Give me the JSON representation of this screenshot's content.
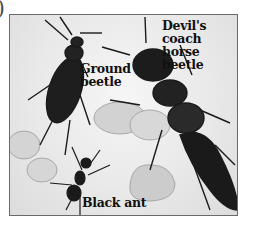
{
  "figure": {
    "partial_marker": ")",
    "labels": {
      "devils_coach_horse_beetle": "Devil's coach horse beetle",
      "devils_line1": "Devil's coach",
      "devils_line2": "horse beetle",
      "ground_beetle_line1": "Ground",
      "ground_beetle_line2": "beetle",
      "black_ant": "Black ant"
    },
    "colors": {
      "frame_border": "#6a6a6a",
      "insect_dark": "#1a1a1a",
      "stone": "#c8c8c8",
      "background": "#ececec"
    }
  }
}
